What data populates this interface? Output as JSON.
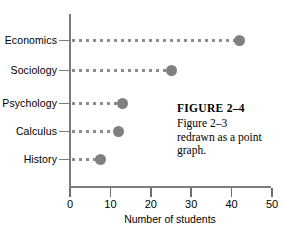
{
  "chart_data": {
    "type": "scatter",
    "title": "",
    "subtitle": "",
    "orientation": "horizontal",
    "categories": [
      "Economics",
      "Sociology",
      "Psychology",
      "Calculus",
      "History"
    ],
    "values": [
      42,
      25,
      13,
      12,
      7.5
    ],
    "xlabel": "Number of students",
    "ylabel": "",
    "xlim": [
      0,
      50
    ],
    "xticks": [
      "0",
      "10",
      "20",
      "30",
      "40",
      "50"
    ],
    "grid": false,
    "legend": false,
    "point_color": "#808080",
    "leader_color": "#8c8c8c",
    "axis_color": "#7d7d7d",
    "series": [
      {
        "name": "Number of students",
        "points": [
          {
            "category": "Economics",
            "value": 42
          },
          {
            "category": "Sociology",
            "value": 25
          },
          {
            "category": "Psychology",
            "value": 13
          },
          {
            "category": "Calculus",
            "value": 12
          },
          {
            "category": "History",
            "value": 7.5
          }
        ]
      }
    ]
  },
  "axis": {
    "x_title": "Number of students",
    "ticks": [
      {
        "label": "0",
        "value": 0
      },
      {
        "label": "10",
        "value": 10
      },
      {
        "label": "20",
        "value": 20
      },
      {
        "label": "30",
        "value": 30
      },
      {
        "label": "40",
        "value": 40
      },
      {
        "label": "50",
        "value": 50
      }
    ]
  },
  "rows": [
    {
      "label": "Economics",
      "value": 42
    },
    {
      "label": "Sociology",
      "value": 25
    },
    {
      "label": "Psychology",
      "value": 13
    },
    {
      "label": "Calculus",
      "value": 12
    },
    {
      "label": "History",
      "value": 7.5
    }
  ],
  "caption": {
    "title": "FIGURE 2–4",
    "line1": "Figure 2–3",
    "line2": "redrawn as a point",
    "line3": "graph."
  }
}
